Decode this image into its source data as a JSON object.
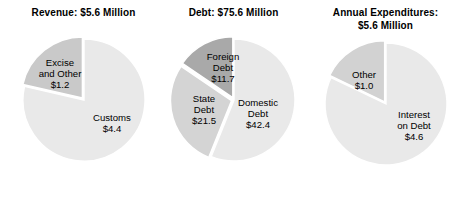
{
  "figure": {
    "background_color": "#ffffff",
    "width": 467,
    "height": 202,
    "slice_border_color": "#ffffff"
  },
  "chart_data": [
    {
      "type": "pie",
      "title": "Revenue: $5.6 Million",
      "title_line1": "Revenue: $5.6 Million",
      "title_line2": "",
      "units": "$ Million",
      "total": 5.6,
      "categories": [
        "Customs",
        "Excise and Other"
      ],
      "values": [
        4.4,
        1.2
      ],
      "labels": [
        "Customs\n$4.4",
        "Excise and Other\n$1.2"
      ],
      "colors": [
        "#e9e9e9",
        "#c9c9c9"
      ],
      "start_angle_deg": 0,
      "direction": "clockwise",
      "legend": "none",
      "grid": false,
      "slices": [
        {
          "name": "Customs",
          "value": 4.4,
          "percent": 78.6,
          "color": "#e9e9e9",
          "label_lines": [
            "Customs",
            "$4.4"
          ],
          "label_x": 92,
          "label_y": 87,
          "exploded": false
        },
        {
          "name": "Excise and Other",
          "value": 1.2,
          "percent": 21.4,
          "color": "#c9c9c9",
          "label_lines": [
            "Excise",
            "and Other",
            "$1.2"
          ],
          "label_x": 40,
          "label_y": 38,
          "exploded": true
        }
      ]
    },
    {
      "type": "pie",
      "title": "Debt: $75.6 Million",
      "title_line1": "Debt: $75.6 Million",
      "title_line2": "",
      "units": "$ Million",
      "total": 75.6,
      "categories": [
        "Domestic Debt",
        "State Debt",
        "Foreign Debt"
      ],
      "values": [
        42.4,
        21.5,
        11.7
      ],
      "labels": [
        "Domestic Debt\n$42.4",
        "State Debt\n$21.5",
        "Foreign Debt\n$11.7"
      ],
      "colors": [
        "#e9e9e9",
        "#d4d4d4",
        "#a9a9a9"
      ],
      "start_angle_deg": 0,
      "direction": "clockwise",
      "legend": "none",
      "grid": false,
      "slices": [
        {
          "name": "Domestic Debt",
          "value": 42.4,
          "percent": 56.1,
          "color": "#e9e9e9",
          "label_lines": [
            "Domestic",
            "Debt",
            "$42.4"
          ],
          "label_x": 88,
          "label_y": 78,
          "exploded": false
        },
        {
          "name": "State Debt",
          "value": 21.5,
          "percent": 28.4,
          "color": "#d4d4d4",
          "label_lines": [
            "State",
            "Debt",
            "$21.5"
          ],
          "label_x": 34,
          "label_y": 74,
          "exploded": true
        },
        {
          "name": "Foreign Debt",
          "value": 11.7,
          "percent": 15.5,
          "color": "#a9a9a9",
          "label_lines": [
            "Foreign",
            "Debt",
            "$11.7"
          ],
          "label_x": 53,
          "label_y": 32,
          "exploded": true
        }
      ]
    },
    {
      "type": "pie",
      "title": "Annual Expenditures: $5.6 Million",
      "title_line1": "Annual Expenditures:",
      "title_line2": "$5.6 Million",
      "units": "$ Million",
      "total": 5.6,
      "categories": [
        "Interest on Debt",
        "Other"
      ],
      "values": [
        4.6,
        1.0
      ],
      "labels": [
        "Interest on Debt\n$4.6",
        "Other\n$1.0"
      ],
      "colors": [
        "#e9e9e9",
        "#d2d2d2"
      ],
      "start_angle_deg": 0,
      "direction": "clockwise",
      "legend": "none",
      "grid": false,
      "slices": [
        {
          "name": "Interest on Debt",
          "value": 4.6,
          "percent": 82.1,
          "color": "#e9e9e9",
          "label_lines": [
            "Interest",
            "on Debt",
            "$4.6"
          ],
          "label_x": 92,
          "label_y": 86,
          "exploded": false
        },
        {
          "name": "Other",
          "value": 1.0,
          "percent": 17.9,
          "color": "#d2d2d2",
          "label_lines": [
            "Other",
            "$1.0"
          ],
          "label_x": 42,
          "label_y": 40,
          "exploded": true
        }
      ]
    }
  ]
}
